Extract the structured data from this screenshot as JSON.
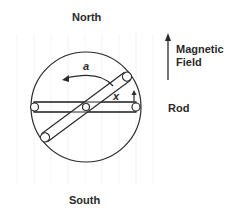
{
  "diagram": {
    "title_top": "North",
    "title_bottom": "South",
    "field_label_line1": "Magnetic",
    "field_label_line2": "Field",
    "rod_label": "Rod",
    "angle_label_a": "a",
    "angle_label_x": "x",
    "colors": {
      "stroke": "#2a2a2a",
      "background": "#ffffff",
      "faint_grid": "#f2f2f2"
    }
  }
}
